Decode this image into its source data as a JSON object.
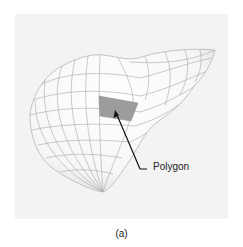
{
  "figure": {
    "caption": "(a)",
    "annotation": {
      "label": "Polygon",
      "target": "highlighted-mesh-face"
    },
    "mesh": {
      "object": "3d-wireframe-surface",
      "surface_color": "#ffffff",
      "wire_color": "#9a9a9a",
      "highlight_color": "#999999"
    },
    "background_color": "#f3f3f3"
  }
}
